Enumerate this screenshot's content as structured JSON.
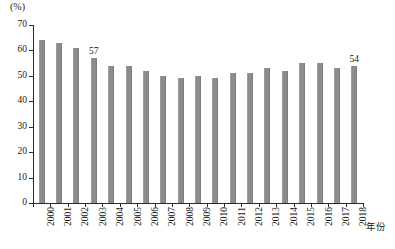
{
  "chart_data": {
    "type": "bar",
    "title": "",
    "subtitle": "",
    "xlabel": "年份",
    "ylabel": "(%)",
    "categories": [
      "2000",
      "2001",
      "2002",
      "2003",
      "2004",
      "2005",
      "2006",
      "2007",
      "2008",
      "2009",
      "2010",
      "2011",
      "2012",
      "2013",
      "2014",
      "2015",
      "2016",
      "2017",
      "2018"
    ],
    "values": [
      64,
      63,
      61,
      57,
      54,
      54,
      52,
      50,
      49,
      50,
      49,
      51,
      51,
      53,
      52,
      55,
      55,
      53,
      54
    ],
    "point_labels": [
      null,
      null,
      null,
      "57",
      null,
      null,
      null,
      null,
      null,
      null,
      null,
      null,
      null,
      null,
      null,
      null,
      null,
      null,
      "54"
    ],
    "ylim": [
      0,
      70
    ],
    "yticks": [
      0,
      10,
      20,
      30,
      40,
      50,
      60,
      70
    ],
    "ytick_labels": [
      "0",
      "10",
      "20",
      "30",
      "40",
      "50",
      "60",
      "70"
    ],
    "grid": false,
    "legend": null,
    "series_color": "#8c8c8c",
    "axis_color": "#2b2b2b"
  }
}
